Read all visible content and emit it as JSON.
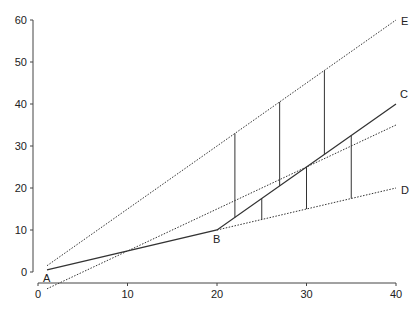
{
  "chart_data": {
    "type": "line",
    "title": "",
    "xlabel": "",
    "ylabel": "",
    "xlim": [
      0,
      40
    ],
    "ylim": [
      0,
      60
    ],
    "x_ticks": [
      0,
      10,
      20,
      30,
      40
    ],
    "y_ticks": [
      0,
      10,
      20,
      30,
      40,
      50,
      60
    ],
    "grid": false,
    "legend": "none",
    "series": [
      {
        "name": "A-B-C",
        "style": "solid",
        "points": [
          [
            1,
            0.5
          ],
          [
            20,
            10
          ],
          [
            40,
            40
          ]
        ]
      },
      {
        "name": "E",
        "style": "dotted",
        "points": [
          [
            1,
            1.5
          ],
          [
            40,
            60
          ]
        ]
      },
      {
        "name": "middle",
        "style": "dotted",
        "points": [
          [
            1,
            -4
          ],
          [
            40,
            35
          ]
        ]
      },
      {
        "name": "B-D",
        "style": "dotted",
        "points": [
          [
            20,
            10
          ],
          [
            40,
            20
          ]
        ]
      }
    ],
    "vertical_segments": [
      {
        "x": 22,
        "y_top": 33,
        "y_bottom": 13
      },
      {
        "x": 27,
        "y_top": 40.5,
        "y_bottom": 20.5
      },
      {
        "x": 32,
        "y_top": 48,
        "y_bottom": 28
      },
      {
        "x": 25,
        "y_top": 17.5,
        "y_bottom": 12.5
      },
      {
        "x": 30,
        "y_top": 25,
        "y_bottom": 15
      },
      {
        "x": 35,
        "y_top": 32.5,
        "y_bottom": 17.5
      }
    ],
    "annotations": [
      {
        "text": "A",
        "x": 1,
        "y": 0.5
      },
      {
        "text": "B",
        "x": 20,
        "y": 10
      },
      {
        "text": "C",
        "x": 40,
        "y": 40
      },
      {
        "text": "D",
        "x": 40,
        "y": 20
      },
      {
        "text": "E",
        "x": 40,
        "y": 60
      }
    ]
  }
}
